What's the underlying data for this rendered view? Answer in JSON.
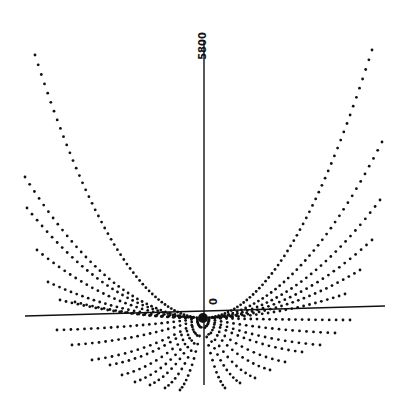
{
  "figure": {
    "axis_label_top": "5800",
    "axis_label_zero": "0",
    "edge_label": "50"
  },
  "colors": {
    "ink": "#111111",
    "paper": "#ffffff"
  },
  "chart_data": {
    "type": "scatter",
    "title": "",
    "xlabel": "",
    "ylabel": "",
    "tick_labels": [
      "0",
      "5800"
    ],
    "grid": false,
    "legend": null,
    "origin_px": [
      203,
      318
    ],
    "vertical_axis_px": {
      "x": 204,
      "y_top": 40,
      "y_bottom": 385
    },
    "horizontal_axis_px": {
      "x1": 25,
      "y1": 316,
      "x2": 385,
      "y2": 306
    },
    "upper_curves_end_px": [
      [
        35,
        55
      ],
      [
        25,
        177
      ],
      [
        27,
        208
      ],
      [
        37,
        250
      ],
      [
        48,
        282
      ],
      [
        60,
        300
      ],
      [
        75,
        302
      ],
      [
        372,
        50
      ],
      [
        382,
        142
      ],
      [
        380,
        200
      ],
      [
        372,
        240
      ],
      [
        360,
        270
      ],
      [
        345,
        294
      ]
    ],
    "lower_rays_end_px": [
      [
        57,
        330
      ],
      [
        72,
        345
      ],
      [
        92,
        360
      ],
      [
        110,
        365
      ],
      [
        122,
        375
      ],
      [
        135,
        382
      ],
      [
        150,
        385
      ],
      [
        165,
        388
      ],
      [
        180,
        390
      ],
      [
        350,
        320
      ],
      [
        335,
        333
      ],
      [
        320,
        345
      ],
      [
        302,
        352
      ],
      [
        285,
        362
      ],
      [
        270,
        370
      ],
      [
        255,
        378
      ],
      [
        240,
        383
      ],
      [
        225,
        388
      ]
    ],
    "dot_spacing_px": 6.5
  }
}
